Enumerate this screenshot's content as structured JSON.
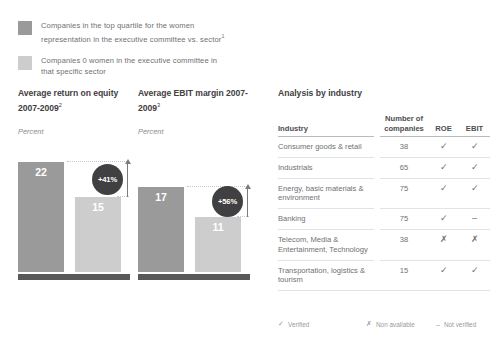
{
  "legend": {
    "items": [
      {
        "swatch": "dark",
        "color": "#9a9a9a",
        "line1": "Companies in the top quartile for the women",
        "line2": "representation in the executive committee vs. sector",
        "footnote": "1"
      },
      {
        "swatch": "light",
        "color": "#cdcdcd",
        "line1": "Companies 0 women in the executive committee in",
        "line2": "that specific sector",
        "footnote": ""
      }
    ]
  },
  "chart_data": [
    {
      "id": "roe",
      "type": "bar",
      "title": "Average return on equity 2007-2009",
      "title_footnote": "2",
      "ylabel": "Percent",
      "categories": [
        "Top quartile women representation",
        "Zero women in executive committee"
      ],
      "values": [
        22,
        15
      ],
      "value_labels": [
        "22",
        "15"
      ],
      "colors": [
        "#9a9a9a",
        "#cdcdcd"
      ],
      "delta_label": "+41%",
      "delta_value": 41,
      "ylim": [
        0,
        26
      ],
      "grid": false,
      "legend_position": "top"
    },
    {
      "id": "ebit",
      "type": "bar",
      "title": "Average EBIT margin 2007-2009",
      "title_footnote": "3",
      "ylabel": "Percent",
      "categories": [
        "Top quartile women representation",
        "Zero women in executive committee"
      ],
      "values": [
        17,
        11
      ],
      "value_labels": [
        "17",
        "11"
      ],
      "colors": [
        "#9a9a9a",
        "#cdcdcd"
      ],
      "delta_label": "+56%",
      "delta_value": 56,
      "ylim": [
        0,
        26
      ],
      "grid": false,
      "legend_position": "top"
    }
  ],
  "table": {
    "title": "Analysis by industry",
    "columns": [
      "Industry",
      "Number of companies",
      "ROE",
      "EBIT"
    ],
    "column_header_lines": {
      "industry": "Industry",
      "number_l1": "Number of",
      "number_l2": "companies",
      "roe": "ROE",
      "ebit": "EBIT"
    },
    "rows": [
      {
        "industry": "Consumer goods & retail",
        "companies": "38",
        "roe": "✓",
        "ebit": "✓"
      },
      {
        "industry": "Industrials",
        "companies": "65",
        "roe": "✓",
        "ebit": "✓"
      },
      {
        "industry": "Energy, basic materials & environment",
        "companies": "75",
        "roe": "✓",
        "ebit": "✓"
      },
      {
        "industry": "Banking",
        "companies": "75",
        "roe": "✓",
        "ebit": "–"
      },
      {
        "industry": "Telecom, Media & Entertainment, Technology",
        "companies": "38",
        "roe": "✗",
        "ebit": "✗"
      },
      {
        "industry": "Transportation, logistics & tourism",
        "companies": "15",
        "roe": "✓",
        "ebit": "✓"
      }
    ]
  },
  "footer_legend": {
    "items": [
      {
        "glyph": "✓",
        "label": "Verified"
      },
      {
        "glyph": "✗",
        "label": "Non available"
      },
      {
        "glyph": "–",
        "label": "Not verified"
      }
    ]
  },
  "colors": {
    "bar_dark": "#9a9a9a",
    "bar_light": "#cdcdcd",
    "baseline": "#58595b",
    "badge": "#404042",
    "text": "#6f7072",
    "heading": "#3f4042"
  }
}
